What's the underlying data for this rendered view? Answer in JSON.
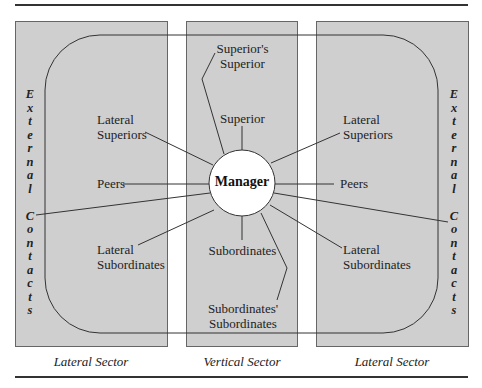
{
  "diagram": {
    "center": {
      "label": "Manager"
    },
    "vertical": {
      "superiors_superior": [
        "Superior's",
        "Superior"
      ],
      "superior": "Superior",
      "subordinates": "Subordinates",
      "subordinates_subordinates": [
        "Subordinates'",
        "Subordinates"
      ]
    },
    "left": {
      "lateral_superiors": [
        "Lateral",
        "Superiors"
      ],
      "peers": "Peers",
      "lateral_subordinates": [
        "Lateral",
        "Subordinates"
      ]
    },
    "right": {
      "lateral_superiors": [
        "Lateral",
        "Superiors"
      ],
      "peers": "Peers",
      "lateral_subordinates": [
        "Lateral",
        "Subordinates"
      ]
    },
    "external": {
      "word1": [
        "E",
        "x",
        "t",
        "e",
        "r",
        "n",
        "a",
        "l"
      ],
      "word2": [
        "C",
        "o",
        "n",
        "t",
        "a",
        "c",
        "t",
        "s"
      ]
    },
    "sectors": [
      "Lateral Sector",
      "Vertical Sector",
      "Lateral Sector"
    ]
  },
  "colors": {
    "panel": "#cfcfcf",
    "line": "#333333",
    "circle": "#ffffff"
  }
}
